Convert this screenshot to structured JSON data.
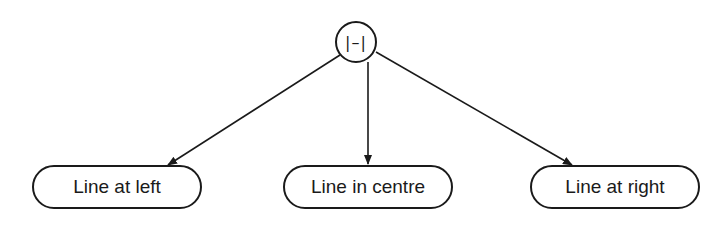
{
  "diagram": {
    "type": "tree",
    "root": {
      "label": "|–|",
      "icon": "line-symbol"
    },
    "children": [
      {
        "label": "Line at left"
      },
      {
        "label": "Line in centre"
      },
      {
        "label": "Line at right"
      }
    ],
    "edges": [
      {
        "from": "root",
        "to": "Line at left"
      },
      {
        "from": "root",
        "to": "Line in centre"
      },
      {
        "from": "root",
        "to": "Line at right"
      }
    ],
    "colors": {
      "stroke": "#1a1a1a",
      "background": "#ffffff"
    }
  }
}
